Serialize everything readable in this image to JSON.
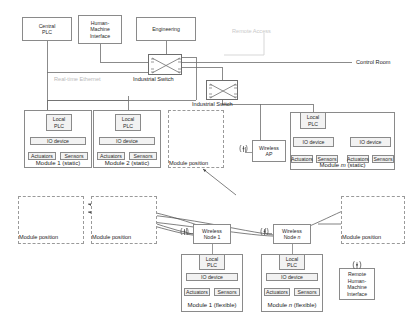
{
  "diagram": {
    "colors": {
      "line": "#6e6e6e",
      "box_border": "#8a8a8a",
      "faint_label": "#c9c9c9",
      "shade": "#f2f2f2"
    }
  },
  "top_nodes": {
    "central_plc": "Central\nPLC",
    "hmi": "Human-\nMachine\nInterface",
    "engineering": "Engineering"
  },
  "switches": {
    "switch1_label": "Industrial Switch",
    "switch2_label": "Industrial Switch"
  },
  "network_labels": {
    "realtime_ethernet": "Real-time Ethernet",
    "control_room": "Control Room",
    "remote_access": "Remote Access"
  },
  "static_modules": [
    {
      "caption": "Module 1 (static)",
      "plc": "Local\nPLC",
      "io_devices": [
        {
          "label": "IO device",
          "actuators": "Actuators",
          "sensors": "Sensors"
        }
      ]
    },
    {
      "caption": "Module 2 (static)",
      "plc": "Local\nPLC",
      "io_devices": [
        {
          "label": "IO device",
          "actuators": "Actuators",
          "sensors": "Sensors"
        }
      ]
    },
    {
      "caption": "Module m (static)",
      "caption_italic_part": "m",
      "plc": "Local\nPLC",
      "io_devices": [
        {
          "label": "IO device",
          "actuators": "Actuators",
          "sensors": "Sensors"
        },
        {
          "label": "IO device",
          "actuators": "Actuators",
          "sensors": "Sensors"
        }
      ]
    }
  ],
  "flexible_modules": [
    {
      "caption": "Module 1 (flexible)",
      "plc": "Local\nPLC",
      "io_devices": [
        {
          "label": "IO device",
          "actuators": "Actuators",
          "sensors": "Sensors"
        }
      ]
    },
    {
      "caption": "Module n (flexible)",
      "caption_italic_part": "n",
      "plc": "Local\nPLC",
      "io_devices": [
        {
          "label": "IO device",
          "actuators": "Actuators",
          "sensors": "Sensors"
        }
      ]
    }
  ],
  "wireless": {
    "access_point": "Wireless\nAP",
    "node_1": "Wireless\nNode 1",
    "node_n": "Wireless\nNode n",
    "remote_hmi": "Remote\nHuman-\nMachine\nInterface"
  },
  "module_positions": [
    {
      "label": "Module position"
    },
    {
      "label": "Module position"
    },
    {
      "label": "Module position"
    },
    {
      "label": "Module position"
    }
  ]
}
